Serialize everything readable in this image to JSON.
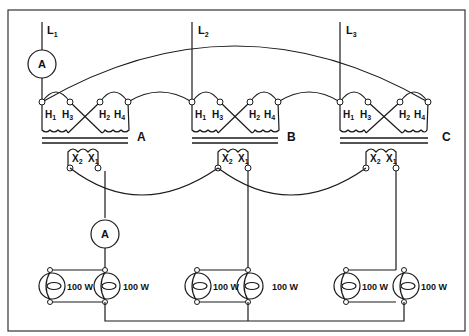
{
  "diagram": {
    "lines": [
      {
        "label": "L",
        "sub": "1"
      },
      {
        "label": "L",
        "sub": "2"
      },
      {
        "label": "L",
        "sub": "3"
      }
    ],
    "transformers": [
      {
        "name": "A",
        "primary_terminals": [
          "H1",
          "H3",
          "H2",
          "H4"
        ],
        "secondary_terminals": [
          "X2",
          "X1"
        ]
      },
      {
        "name": "B",
        "primary_terminals": [
          "H1",
          "H3",
          "H2",
          "H4"
        ],
        "secondary_terminals": [
          "X2",
          "X1"
        ]
      },
      {
        "name": "C",
        "primary_terminals": [
          "H1",
          "H3",
          "H2",
          "H4"
        ],
        "secondary_terminals": [
          "X2",
          "X1"
        ]
      }
    ],
    "terminal_labels": {
      "h": "H",
      "x": "X",
      "h1": "1",
      "h3": "3",
      "h2": "2",
      "h4": "4",
      "x2": "2",
      "x1": "1"
    },
    "ammeters": [
      {
        "label": "A",
        "location": "Line L1 (primary)"
      },
      {
        "label": "A",
        "location": "Transformer A secondary X1"
      }
    ],
    "lamps": [
      {
        "group": "A",
        "rating": "100 W"
      },
      {
        "group": "A",
        "rating": "100 W"
      },
      {
        "group": "B",
        "rating": "100 W"
      },
      {
        "group": "B",
        "rating": "100 W"
      },
      {
        "group": "C",
        "rating": "100 W"
      },
      {
        "group": "C",
        "rating": "100 W"
      }
    ],
    "colors": {
      "line": "#1a1a1a",
      "background": "#ffffff",
      "frame": "#333333"
    }
  }
}
